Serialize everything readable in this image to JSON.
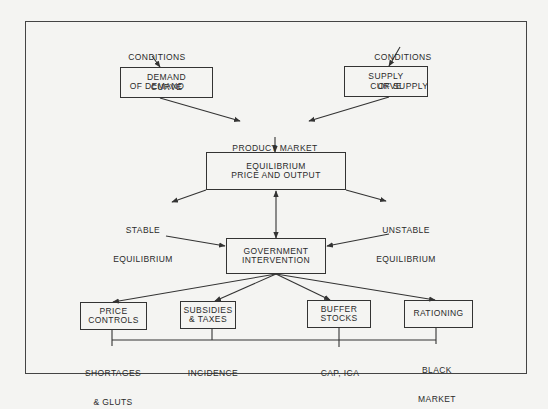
{
  "diagram": {
    "inputs": {
      "demand_conditions": [
        "CONDITIONS",
        "OF DEMAND"
      ],
      "supply_conditions": [
        "CONDITIONS",
        "OF SUPPLY"
      ]
    },
    "curves": {
      "demand": [
        "DEMAND",
        "CURVE"
      ],
      "supply": [
        "SUPPLY",
        "CURVE"
      ]
    },
    "product_market": "PRODUCT MARKET",
    "equilibrium": [
      "EQUILIBRIUM",
      "PRICE AND OUTPUT"
    ],
    "stable": [
      "STABLE",
      "EQUILIBRIUM"
    ],
    "unstable": [
      "UNSTABLE",
      "EQUILIBRIUM"
    ],
    "government": [
      "GOVERNMENT",
      "INTERVENTION"
    ],
    "interventions": [
      {
        "label": [
          "PRICE",
          "CONTROLS"
        ],
        "outcome": [
          "SHORTAGES",
          "& GLUTS"
        ]
      },
      {
        "label": [
          "SUBSIDIES",
          "& TAXES"
        ],
        "outcome": [
          "INCIDENCE"
        ]
      },
      {
        "label": [
          "BUFFER",
          "STOCKS"
        ],
        "outcome": [
          "CAP, ICA"
        ]
      },
      {
        "label": [
          "RATIONING"
        ],
        "outcome": [
          "BLACK",
          "MARKET"
        ]
      }
    ]
  },
  "colors": {
    "line": "#333333",
    "background": "#f4f4f2",
    "text": "#2a2a2a"
  }
}
